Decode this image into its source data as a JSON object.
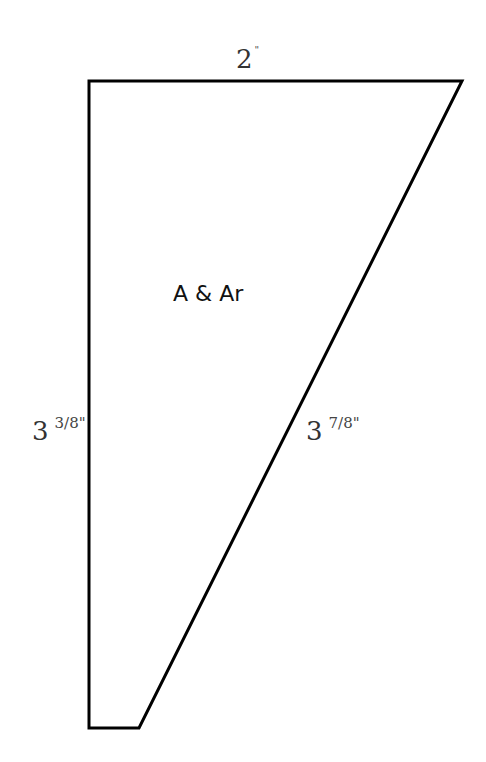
{
  "diagram": {
    "type": "pattern-piece",
    "piece_label": "A & Ar",
    "outline_color": "#000000",
    "background": "#ffffff",
    "shape": {
      "vertices": [
        [
          89,
          81
        ],
        [
          462,
          81
        ],
        [
          139,
          728
        ],
        [
          89,
          728
        ]
      ]
    },
    "dimensions": {
      "top": {
        "whole": "2",
        "fraction": "",
        "unit": "\""
      },
      "left": {
        "whole": "3",
        "fraction": "3/8",
        "unit": "\""
      },
      "diagonal": {
        "whole": "3",
        "fraction": "7/8",
        "unit": "\""
      }
    }
  }
}
